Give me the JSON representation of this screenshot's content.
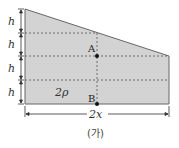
{
  "figure": {
    "caption": "(가)",
    "shape_fill": "#d3d3d3",
    "shape_stroke": "#555555",
    "left_labels": [
      "h",
      "h",
      "h",
      "h"
    ],
    "points": {
      "A": {
        "label": "A"
      },
      "B": {
        "label": "B"
      }
    },
    "density_label": "2ρ",
    "width_label": "2x"
  }
}
